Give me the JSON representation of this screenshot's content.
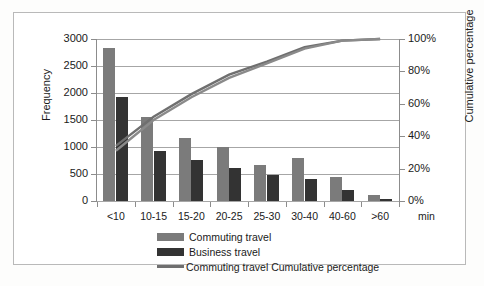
{
  "chart_data": {
    "type": "bar",
    "title": "",
    "xlabel": "min",
    "ylabel": "Frequency",
    "y2label": "Cumulative percentage",
    "categories": [
      "<10",
      "10-15",
      "15-20",
      "20-25",
      "25-30",
      "30-40",
      "40-60",
      ">60"
    ],
    "ylim": [
      0,
      3000
    ],
    "y2lim": [
      0,
      100
    ],
    "yticks": [
      "0",
      "500",
      "1000",
      "1500",
      "2000",
      "2500",
      "3000"
    ],
    "ytick_values": [
      0,
      500,
      1000,
      1500,
      2000,
      2500,
      3000
    ],
    "y2ticks": [
      "0%",
      "20%",
      "40%",
      "60%",
      "80%",
      "100%"
    ],
    "y2tick_values": [
      0,
      20,
      40,
      60,
      80,
      100
    ],
    "grid": true,
    "legend_position": "bottom",
    "series": [
      {
        "name": "Commuting travel",
        "type": "bar",
        "color": "#7b7b7b",
        "axis": "left",
        "values": [
          2830,
          1560,
          1170,
          1000,
          660,
          800,
          440,
          110
        ]
      },
      {
        "name": "Business travel",
        "type": "bar",
        "color": "#333333",
        "axis": "left",
        "values": [
          1930,
          930,
          760,
          610,
          490,
          410,
          210,
          45
        ]
      },
      {
        "name": "Commuting travel Cumulative percentage",
        "type": "line",
        "color": "#6f6f6f",
        "axis": "right",
        "values": [
          34,
          52,
          66,
          78,
          86,
          95,
          99,
          100
        ]
      },
      {
        "name": "Business travel Cumulative percentage",
        "type": "line",
        "color": "#8a8a8a",
        "axis": "right",
        "values": [
          31,
          50,
          64,
          76,
          85,
          94,
          99,
          100
        ]
      }
    ]
  },
  "axes": {
    "left_title": "Frequency",
    "right_title": "Cumulative percentage",
    "x_unit": "min"
  },
  "legend": {
    "items": [
      {
        "label": "Commuting travel",
        "marker": "swatch-gray"
      },
      {
        "label": "Business travel",
        "marker": "swatch-dark"
      },
      {
        "label": "Commuting travel Cumulative percentage",
        "marker": "line-gray"
      }
    ]
  }
}
